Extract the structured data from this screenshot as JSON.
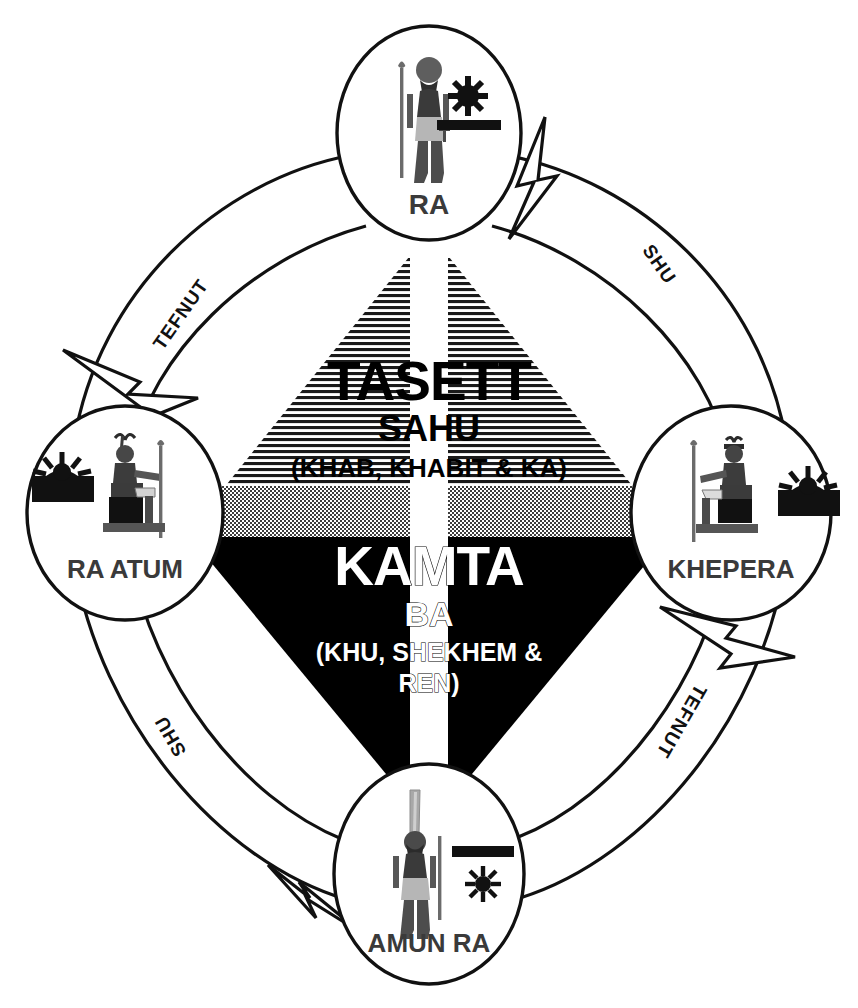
{
  "diagram": {
    "colors": {
      "ink": "#111111",
      "label_gray": "#3a3a3a",
      "black_fill": "#000000",
      "gray_band": "#9a9a9a",
      "hatch_line": "#111111",
      "background": "#ffffff"
    }
  },
  "nodes": [
    {
      "id": "ra",
      "label": "RA",
      "position": "top",
      "glyph_name": "ra-falcon-headed-god-glyph",
      "symbol": "sun-above-horizon-bar",
      "symbol_order": "sun-over-bar"
    },
    {
      "id": "khepera",
      "label": "KHEPERA",
      "position": "right",
      "glyph_name": "khepera-enthroned-god-glyph",
      "symbol": "sun-rising-over-hill",
      "symbol_order": "sun-behind-mound"
    },
    {
      "id": "amun-ra",
      "label": "AMUN RA",
      "position": "bottom",
      "glyph_name": "amun-ra-plumed-god-glyph",
      "symbol": "bar-above-sun",
      "symbol_order": "bar-over-sun"
    },
    {
      "id": "ra-atum",
      "label": "RA ATUM",
      "position": "left",
      "glyph_name": "ra-atum-enthroned-god-glyph",
      "symbol": "sun-setting-over-hill",
      "symbol_order": "sun-behind-mound"
    }
  ],
  "arcs": [
    {
      "id": "ra-to-khepera",
      "label": "SHU",
      "from": "ra",
      "to": "khepera",
      "quadrant": "upper-right"
    },
    {
      "id": "khepera-to-amun",
      "label": "TEFNUT",
      "from": "khepera",
      "to": "amun-ra",
      "quadrant": "lower-right"
    },
    {
      "id": "amun-to-ratum",
      "label": "SHU",
      "from": "amun-ra",
      "to": "ra-atum",
      "quadrant": "lower-left"
    },
    {
      "id": "ratum-to-ra",
      "label": "TEFNUT",
      "from": "ra-atum",
      "to": "ra",
      "quadrant": "upper-left"
    }
  ],
  "center": {
    "upper": {
      "id": "tasett",
      "name": "TASETT",
      "subtitle": "SAHU",
      "detail": "(KHAB, KHABIT & KA)",
      "fill": "horizontal-hatch",
      "shape": "triangle-pointing-up"
    },
    "lower": {
      "id": "kamta",
      "name": "KAMTA",
      "subtitle": "BA",
      "detail_line1": "(KHU, SHEKHEM &",
      "detail_line2": "REN)",
      "fill": "solid-black",
      "shape": "triangle-pointing-down"
    },
    "band": {
      "id": "horizon-band",
      "fill": "gray-dither"
    },
    "stripe": {
      "id": "vertical-white-stripe",
      "fill": "white"
    }
  }
}
